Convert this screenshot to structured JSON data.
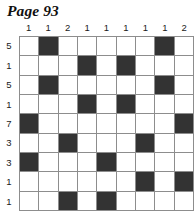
{
  "page": {
    "title": "Page 93"
  },
  "puzzle": {
    "type": "nonogram-grid",
    "rows": 9,
    "columns": 9,
    "column_clues": [
      "1",
      "1",
      "2",
      "1",
      "1",
      "1",
      "1",
      "1",
      "2"
    ],
    "row_clues": [
      "5",
      "1",
      "5",
      "1",
      "7",
      "3",
      "3",
      "1",
      "1"
    ],
    "colors": {
      "filled_cell": "#333333",
      "empty_cell": "#ffffff",
      "grid_line": "#8d8d8d",
      "text": "#1a1a1a"
    },
    "grid": [
      [
        0,
        1,
        0,
        0,
        0,
        0,
        0,
        1,
        0
      ],
      [
        0,
        0,
        0,
        1,
        0,
        1,
        0,
        0,
        0
      ],
      [
        0,
        1,
        0,
        0,
        0,
        0,
        0,
        1,
        0
      ],
      [
        0,
        0,
        0,
        1,
        0,
        1,
        0,
        0,
        0
      ],
      [
        1,
        0,
        0,
        0,
        0,
        0,
        0,
        0,
        1
      ],
      [
        0,
        0,
        1,
        0,
        0,
        0,
        1,
        0,
        0
      ],
      [
        1,
        0,
        0,
        0,
        1,
        0,
        0,
        0,
        0
      ],
      [
        0,
        0,
        0,
        0,
        0,
        0,
        1,
        0,
        1
      ],
      [
        0,
        0,
        1,
        0,
        1,
        0,
        0,
        0,
        0
      ]
    ]
  }
}
